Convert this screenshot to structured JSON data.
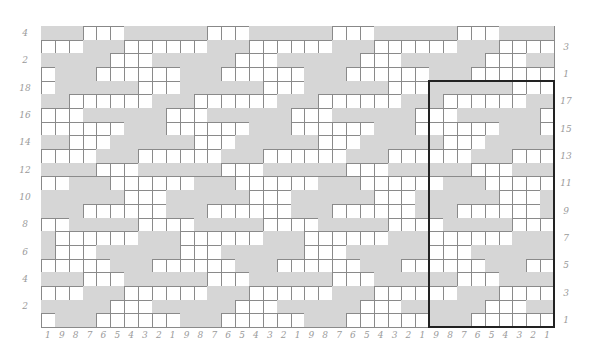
{
  "chart": {
    "columns": 37,
    "rows": 22,
    "repeat_width": 9,
    "colors": {
      "contrast": "#d6d6d6",
      "main": "#ffffff",
      "grid_line": "#8a8a8a",
      "label": "#9a9a9a",
      "repeat_outline": "#222222"
    },
    "pattern_rows": [
      "GGGWWWGGG",
      "WWWGGGWWW",
      "GGGGGWWWG",
      "WGGGWWWWW",
      "WGGGGGGWW",
      "GGWWWWWWG",
      "WWWGGGGGG",
      "WWWWWWGGG",
      "GGWWWGGGG",
      "WWWWGGGWW",
      "GGGGWWWGG",
      "WWGGGWWWW",
      "GGGGGGWWW",
      "GGGWWWWWW",
      "WWGGGGGWW",
      "GWWWWWWGG",
      "GWWWGGGGG",
      "WWWWWGGGW",
      "GGGWWWGGG",
      "WWWGGGWWW",
      "GGGGGWWWG",
      "WGGGWWWWW"
    ],
    "left_labels": [
      {
        "row": 0,
        "text": "4"
      },
      {
        "row": 2,
        "text": "2"
      },
      {
        "row": 4,
        "text": "18"
      },
      {
        "row": 6,
        "text": "16"
      },
      {
        "row": 8,
        "text": "14"
      },
      {
        "row": 10,
        "text": "12"
      },
      {
        "row": 12,
        "text": "10"
      },
      {
        "row": 14,
        "text": "8"
      },
      {
        "row": 16,
        "text": "6"
      },
      {
        "row": 18,
        "text": "4"
      },
      {
        "row": 20,
        "text": "2"
      }
    ],
    "right_labels": [
      {
        "row": 1,
        "text": "3"
      },
      {
        "row": 3,
        "text": "1"
      },
      {
        "row": 5,
        "text": "17"
      },
      {
        "row": 7,
        "text": "15"
      },
      {
        "row": 9,
        "text": "13"
      },
      {
        "row": 11,
        "text": "11"
      },
      {
        "row": 13,
        "text": "9"
      },
      {
        "row": 15,
        "text": "7"
      },
      {
        "row": 17,
        "text": "5"
      },
      {
        "row": 19,
        "text": "3"
      },
      {
        "row": 21,
        "text": "1"
      }
    ],
    "bottom_labels": [
      "1",
      "9",
      "8",
      "7",
      "6",
      "5",
      "4",
      "3",
      "2",
      "1",
      "9",
      "8",
      "7",
      "6",
      "5",
      "4",
      "3",
      "2",
      "1",
      "9",
      "8",
      "7",
      "6",
      "5",
      "4",
      "3",
      "2",
      "1",
      "9",
      "8",
      "7",
      "6",
      "5",
      "4",
      "3",
      "2",
      "1"
    ],
    "repeat_box": {
      "first_col": 28,
      "last_col": 36,
      "first_row": 4,
      "last_row": 21,
      "label": "pattern repeat"
    }
  }
}
